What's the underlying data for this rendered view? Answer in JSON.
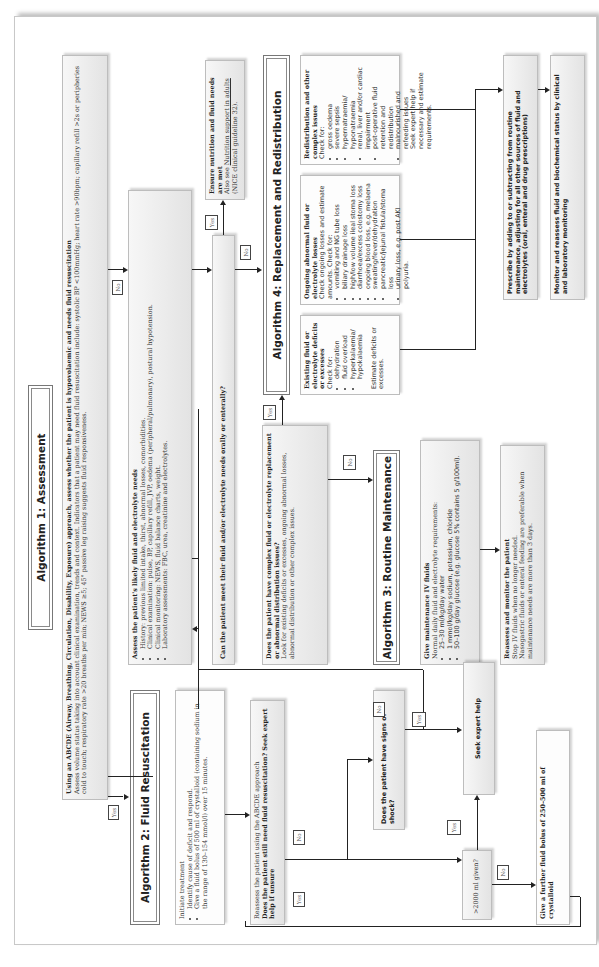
{
  "algorithm1": {
    "title": "Algorithm 1: Assessment",
    "abcde": {
      "heading": "Using an ABCDE (Airway, Breathing, Circulation, Disability, Exposure) approach, assess whether the patient is hypovolaemic and needs fluid resuscitation",
      "body": "Assess volume status taking into account clinical examination, trends and context. Indicators that a patient may need fluid resuscitation include: systolic BP <100mmHg; heart rate >90bpm; capillary refill >2s or peripheries cold to touch; respiratory rate >20 breaths per min; NEWS ≥5; 45° passive leg raising suggests fluid responsiveness."
    },
    "assess_needs": {
      "heading": "Assess the patient's likely fluid and electrolyte needs",
      "items": [
        "History: previous limited intake, thirst, abnormal losses, comorbidities.",
        "Clinical examination: pulse, BP, capillary refill, JVP, oedema (peripheral/pulmonary), postural hypotension.",
        "Clinical monitoring: NEWS, fluid balance charts, weight.",
        "Laboratory assessments: FBC, urea, creatinine and electrolytes."
      ]
    },
    "can_meet": "Can the patient meet their fluid and/or electrolyte needs orally or enterally?",
    "nutrition": {
      "heading": "Ensure nutrition and fluid needs are met",
      "prefix": "Also see ",
      "link": "Nutrition support in adults",
      "suffix": " (NICE clinical guideline 32)."
    },
    "complex": {
      "heading": "Does the patient have complex fluid or electrolyte replacement or abnormal distribution issues?",
      "body": "Look for existing deficits or excesses, ongoing abnormal losses, abnormal distribution or other complex issues."
    }
  },
  "algorithm2": {
    "title": "Algorithm 2: Fluid Resuscitation",
    "initiate": {
      "heading": "Initiate treatment",
      "items": [
        "Identify cause of deficit and respond.",
        "Give a fluid bolus of 500 ml of crystalloid (containing sodium in the range of 130–154 mmol/l) over 15 minutes."
      ]
    },
    "reassess": {
      "line1": "Reassess the patient using the ABCDE approach",
      "question": "Does the patient still need fluid resuscitation? Seek expert help if unsure"
    },
    "shock": "Does the patient have signs of shock?",
    "seek_help": "Seek expert help",
    "over2000": ">2000 ml given?",
    "further_bolus": "Give a further fluid bolus of 250–500 ml of crystalloid"
  },
  "algorithm3": {
    "title": "Algorithm 3: Routine Maintenance",
    "maintenance": {
      "heading": "Give maintenance IV fluids",
      "intro": "Normal daily fluid and electrolyte requirements:",
      "items": [
        "25–30 ml/kg/day water",
        "1 mmol/kg/day sodium, potassium, chloride",
        "50–100 g/day glucose (e.g. glucose 5% contains 5 g/100ml)."
      ]
    },
    "monitor": {
      "heading": "Reassess and monitor the patient",
      "line1": "Stop IV fluids when no longer needed.",
      "line2": "Nasogastric fluids or enteral feeding are preferable when maintenance needs are more than 3 days."
    }
  },
  "algorithm4": {
    "title": "Algorithm 4: Replacement and Redistribution",
    "existing": {
      "heading": "Existing fluid or electrolyte deficits or excesses",
      "check": "Check for:",
      "items": [
        "dehydration",
        "fluid overload",
        "hyperkalaemia/ hypokalaemia"
      ],
      "footer": "Estimate deficits or excesses."
    },
    "ongoing": {
      "heading": "Ongoing abnormal fluid or electrolyte losses",
      "check": "Check ongoing losses and estimate amounts. Check for:",
      "items": [
        "vomiting and NG tube loss",
        "biliary drainage loss",
        "high/low volume ileal stoma loss",
        "diarrhoea/excess colostomy loss",
        "ongoing blood loss, e.g. melaena",
        "sweating/fever/dehydration",
        "pancreatic/jejunal fistula/stoma loss",
        "urinary loss, e.g. post AKI polyuria."
      ]
    },
    "redistribution": {
      "heading": "Redistribution and other complex issues",
      "check": "Check for:",
      "items": [
        "gross oedema",
        "severe sepsis",
        "hypernatraemia/ hyponatraemia",
        "renal, liver and/or cardiac impairment",
        "post-operative fluid retention and redistribution",
        "malnourished and refeeding issues"
      ],
      "footer": "Seek expert help if necessary and estimate requirements."
    },
    "prescribe": "Prescribe by adding to or subtracting from routine maintenance, adjusting for all other sources of fluid and electrolytes (oral, enteral and drug prescriptions)",
    "monitor": "Monitor and reassess fluid and biochemical status by clinical and laboratory monitoring"
  },
  "labels": {
    "yes": "Yes",
    "no": "No"
  }
}
